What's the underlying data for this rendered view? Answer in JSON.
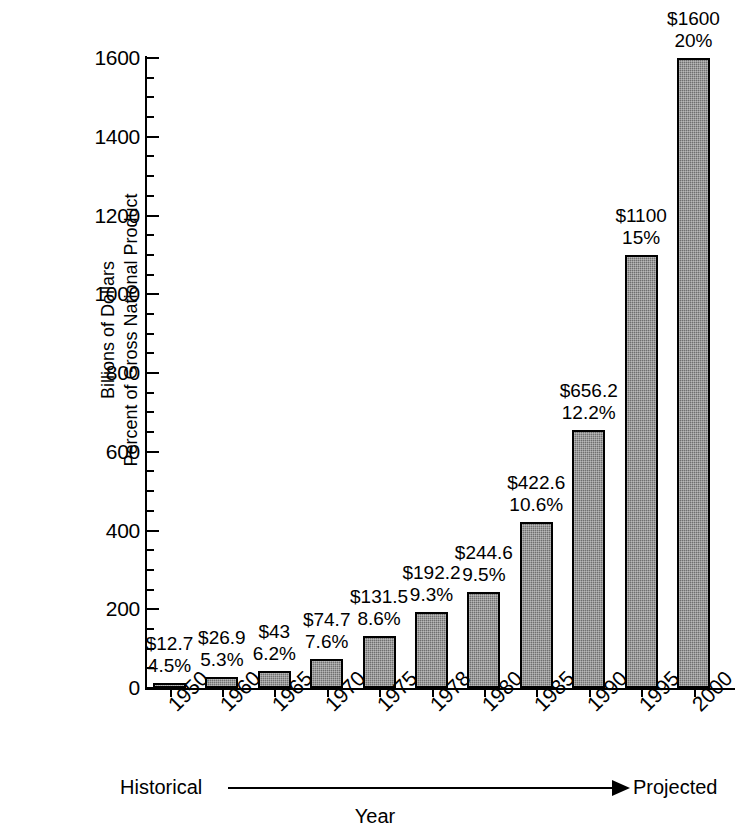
{
  "chart_data": {
    "type": "bar",
    "title": "",
    "xlabel": "Year",
    "ylabel": "Billions of Dollars\nPercent of Gross National Product",
    "ylabel_lines": [
      "Billions of Dollars",
      "Percent of Gross National Product"
    ],
    "ylim": [
      0,
      1600
    ],
    "ytick_labels": [
      "0",
      "200",
      "400",
      "600",
      "800",
      "1000",
      "1200",
      "1400",
      "1600"
    ],
    "ytick_values": [
      0,
      200,
      400,
      600,
      800,
      1000,
      1200,
      1400,
      1600
    ],
    "minor_tick_step": 50,
    "grid": false,
    "legend": "none",
    "categories": [
      "1950",
      "1960",
      "1965",
      "1970",
      "1975",
      "1978",
      "1980",
      "1985",
      "1990",
      "1995",
      "2000"
    ],
    "values": [
      12.7,
      26.9,
      43,
      74.7,
      131.5,
      192.2,
      244.6,
      422.6,
      656.2,
      1100,
      1600
    ],
    "series": [
      {
        "name": "Billions of Dollars",
        "values": [
          12.7,
          26.9,
          43,
          74.7,
          131.5,
          192.2,
          244.6,
          422.6,
          656.2,
          1100,
          1600
        ]
      },
      {
        "name": "Percent of Gross National Product",
        "values": [
          4.5,
          5.3,
          6.2,
          7.6,
          8.6,
          9.3,
          9.5,
          10.6,
          12.2,
          15,
          20
        ]
      }
    ],
    "bars": [
      {
        "category": "1950",
        "dollars": 12.7,
        "dollar_label": "$12.7",
        "percent": 4.5,
        "percent_label": "4.5%"
      },
      {
        "category": "1960",
        "dollars": 26.9,
        "dollar_label": "$26.9",
        "percent": 5.3,
        "percent_label": "5.3%"
      },
      {
        "category": "1965",
        "dollars": 43,
        "dollar_label": "$43",
        "percent": 6.2,
        "percent_label": "6.2%"
      },
      {
        "category": "1970",
        "dollars": 74.7,
        "dollar_label": "$74.7",
        "percent": 7.6,
        "percent_label": "7.6%"
      },
      {
        "category": "1975",
        "dollars": 131.5,
        "dollar_label": "$131.5",
        "percent": 8.6,
        "percent_label": "8.6%"
      },
      {
        "category": "1978",
        "dollars": 192.2,
        "dollar_label": "$192.2",
        "percent": 9.3,
        "percent_label": "9.3%"
      },
      {
        "category": "1980",
        "dollars": 244.6,
        "dollar_label": "$244.6",
        "percent": 9.5,
        "percent_label": "9.5%"
      },
      {
        "category": "1985",
        "dollars": 422.6,
        "dollar_label": "$422.6",
        "percent": 10.6,
        "percent_label": "10.6%"
      },
      {
        "category": "1990",
        "dollars": 656.2,
        "dollar_label": "$656.2",
        "percent": 12.2,
        "percent_label": "12.2%"
      },
      {
        "category": "1995",
        "dollars": 1100,
        "dollar_label": "$1100",
        "percent": 15,
        "percent_label": "15%"
      },
      {
        "category": "2000",
        "dollars": 1600,
        "dollar_label": "$1600",
        "percent": 20,
        "percent_label": "20%"
      }
    ],
    "annotations": {
      "left_label": "Historical",
      "right_label": "Projected",
      "arrow": "left-to-right-arrow"
    }
  },
  "colors": {
    "bar_fill": "#6f6f6f",
    "bar_outline": "#000000",
    "axis": "#000000",
    "background": "#ffffff",
    "text": "#000000"
  }
}
